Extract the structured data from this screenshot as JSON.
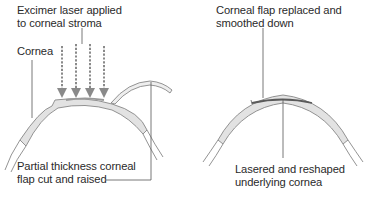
{
  "left_panel": {
    "laser_label": [
      "Excimer laser applied",
      "to corneal stroma"
    ],
    "cornea_label": "Cornea",
    "flap_label": [
      "Partial thickness corneal",
      "flap cut and raised"
    ]
  },
  "right_panel": {
    "flap_replaced_label": [
      "Corneal flap replaced and",
      "smoothed down"
    ],
    "reshaped_label": [
      "Lasered and reshaped",
      "underlying cornea"
    ]
  },
  "colors": {
    "cornea_fill": "#e2e2e2",
    "outline": "#7a7a7a",
    "laser_arrow": "#8a8a8a",
    "ablation_zone": "#5a5a5a",
    "text": "#2a2a2a"
  }
}
